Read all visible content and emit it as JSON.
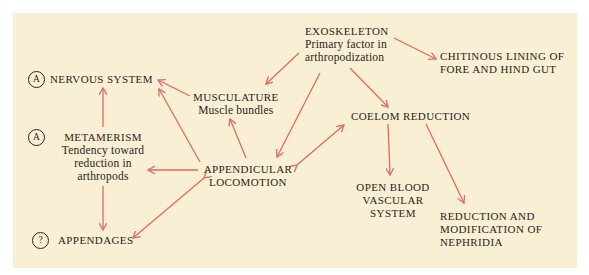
{
  "diagram": {
    "colors": {
      "background": "#f8efd4",
      "arrow": "#e06a6a",
      "text": "#2a2420"
    },
    "nodes": {
      "exoskeleton": {
        "title": "EXOSKELETON",
        "sub1": "Primary factor in",
        "sub2": "arthropodization"
      },
      "chitinous": {
        "line1": "CHITINOUS LINING OF",
        "line2": "FORE AND HIND GUT"
      },
      "nervous": {
        "badge": "A",
        "title": "NERVOUS SYSTEM"
      },
      "musculature": {
        "title": "MUSCULATURE",
        "sub": "Muscle bundles"
      },
      "coelom": {
        "title": "COELOM REDUCTION"
      },
      "metamerism": {
        "badge": "A",
        "title": "METAMERISM",
        "sub1": "Tendency toward",
        "sub2": "reduction in",
        "sub3": "arthropods"
      },
      "appendicular": {
        "line1": "APPENDICULAR",
        "line2": "LOCOMOTION"
      },
      "open_blood": {
        "line1": "OPEN BLOOD",
        "line2": "VASCULAR",
        "line3": "SYSTEM"
      },
      "nephridia": {
        "line1": "REDUCTION AND",
        "line2": "MODIFICATION OF",
        "line3": "NEPHRIDIA"
      },
      "appendages": {
        "badge": "?",
        "title": "APPENDAGES"
      }
    },
    "edges": [
      {
        "from": "exoskeleton",
        "to": "chitinous"
      },
      {
        "from": "exoskeleton",
        "to": "musculature"
      },
      {
        "from": "exoskeleton",
        "to": "appendicular"
      },
      {
        "from": "exoskeleton",
        "to": "coelom"
      },
      {
        "from": "musculature",
        "to": "nervous"
      },
      {
        "from": "appendicular",
        "to": "nervous"
      },
      {
        "from": "appendicular",
        "to": "musculature"
      },
      {
        "from": "appendicular",
        "to": "metamerism"
      },
      {
        "from": "appendicular",
        "to": "coelom",
        "bidirectional": true
      },
      {
        "from": "appendicular",
        "to": "appendages",
        "bidirectional": true
      },
      {
        "from": "metamerism",
        "to": "nervous"
      },
      {
        "from": "metamerism",
        "to": "appendages"
      },
      {
        "from": "coelom",
        "to": "open_blood"
      },
      {
        "from": "coelom",
        "to": "nephridia"
      }
    ]
  }
}
